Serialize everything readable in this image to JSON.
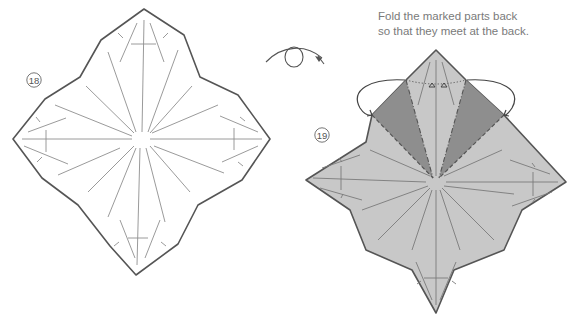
{
  "diagram": {
    "steps": [
      {
        "number": "18",
        "label": "18",
        "description": "Crease pattern with radial creases (white paper)"
      },
      {
        "number": "19",
        "label": "19",
        "description": "Gray paper with two darker shaded flaps marked to fold back"
      }
    ],
    "instruction": {
      "line1": "Fold the marked parts back",
      "line2": "so that they meet at the back."
    },
    "symbols": {
      "turn_over": "turn-over-arrow",
      "fold_back_arrows": 2,
      "mountain_fold_lines": "dash-dot",
      "valley_fold_lines": "dashed"
    },
    "colors": {
      "outline": "#555555",
      "crease": "#8a8a8a",
      "paper_white": "#ffffff",
      "paper_gray": "#c8c8c8",
      "flap_dark": "#8e8e8e",
      "text": "#7a7a7a"
    }
  }
}
